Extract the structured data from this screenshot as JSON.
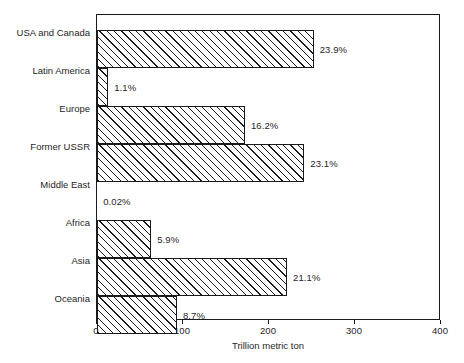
{
  "chart_data": {
    "type": "bar",
    "orientation": "horizontal",
    "title": "",
    "subtitle": "",
    "xlabel": "Trillion metric ton",
    "ylabel": "",
    "xlim": [
      0,
      400
    ],
    "xticks": [
      0,
      100,
      200,
      300,
      400
    ],
    "xtick_labels": [
      "0",
      "100",
      "200",
      "300",
      "400"
    ],
    "grid": false,
    "legend": null,
    "categories": [
      "USA and Canada",
      "Latin America",
      "Europe",
      "Former USSR",
      "Middle East",
      "Africa",
      "Asia",
      "Oceania"
    ],
    "values": [
      252,
      13,
      172,
      241,
      0.2,
      63,
      221,
      93
    ],
    "data_labels": [
      "23.9%",
      "1.1%",
      "16.2%",
      "23.1%",
      "0.02%",
      "5.9%",
      "21.1%",
      "8.7%"
    ],
    "series": [
      {
        "name": "Coal resources",
        "values": [
          252,
          13,
          172,
          241,
          0.2,
          63,
          221,
          93
        ],
        "labels": [
          "23.9%",
          "1.1%",
          "16.2%",
          "23.1%",
          "0.02%",
          "5.9%",
          "21.1%",
          "8.7%"
        ]
      }
    ],
    "style": {
      "bar_fill": "#ffffff",
      "bar_edge": "#1a1a1a",
      "hatch": "/",
      "frame": "#1a1a1a",
      "text": "#262626"
    }
  },
  "caption": {
    "text": ""
  }
}
